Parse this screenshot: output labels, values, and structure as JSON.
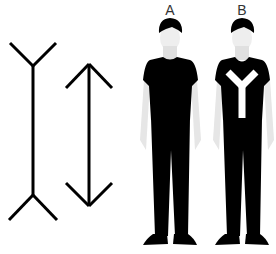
{
  "diagram": {
    "figures": [
      {
        "id": "fins-out-line",
        "description": "Vertical line with outward fins (Y-shaped ends)"
      },
      {
        "id": "arrow-line",
        "description": "Vertical double-headed arrow"
      }
    ],
    "persons": [
      {
        "label": "A",
        "shirt": "plain black t-shirt"
      },
      {
        "label": "B",
        "shirt": "black t-shirt with white Y pattern"
      }
    ],
    "colors": {
      "background": "#ffffff",
      "ink": "#000000",
      "skin": "#e4e4e4",
      "label": "#333333"
    }
  }
}
